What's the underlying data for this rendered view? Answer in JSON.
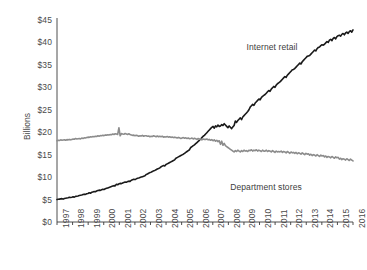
{
  "chart_data": {
    "type": "line",
    "title": "",
    "xlabel": "",
    "ylabel": "Billions",
    "ylim": [
      0,
      45
    ],
    "ytick_labels": [
      "$45",
      "$40",
      "$35",
      "$30",
      "$25",
      "$20",
      "$15",
      "$10",
      "$5",
      "$0"
    ],
    "ytick_values": [
      45,
      40,
      35,
      30,
      25,
      20,
      15,
      10,
      5,
      0
    ],
    "grid": false,
    "legend_position": "inline-annotation",
    "x": [
      "1997",
      "1998",
      "1999",
      "2000",
      "2001",
      "2002",
      "2003",
      "2004",
      "2005",
      "2006",
      "2007",
      "2008",
      "2009",
      "2010",
      "2011",
      "2012",
      "2013",
      "2014",
      "2015",
      "2016"
    ],
    "categories": [
      "1997",
      "1998",
      "1999",
      "2000",
      "2001",
      "2002",
      "2003",
      "2004",
      "2005",
      "2006",
      "2007",
      "2008",
      "2009",
      "2010",
      "2011",
      "2012",
      "2013",
      "2014",
      "2015",
      "2016"
    ],
    "series": [
      {
        "name": "Internet retail",
        "color": "#1a1a1a",
        "label_x": 272,
        "label_y": 42,
        "values": [
          5.1,
          5.6,
          6.3,
          7.2,
          8.4,
          9.3,
          10.6,
          12.3,
          14.2,
          16.6,
          19.6,
          21.4,
          22.5,
          25.6,
          28.4,
          31.2,
          34.2,
          37.1,
          39.6,
          42.4
        ],
        "monthly": [
          5.0,
          5.05,
          5.1,
          5.15,
          5.2,
          5.1,
          5.25,
          5.3,
          5.35,
          5.4,
          5.5,
          5.45,
          5.5,
          5.6,
          5.55,
          5.7,
          5.75,
          5.8,
          5.9,
          5.95,
          6.0,
          6.1,
          6.2,
          6.15,
          6.3,
          6.35,
          6.5,
          6.4,
          6.6,
          6.7,
          6.8,
          6.75,
          6.9,
          7.0,
          7.1,
          7.05,
          7.2,
          7.3,
          7.25,
          7.4,
          7.5,
          7.6,
          7.7,
          7.8,
          7.9,
          8.0,
          8.1,
          8.05,
          8.4,
          8.3,
          8.5,
          8.6,
          8.55,
          8.7,
          8.8,
          8.9,
          8.85,
          9.0,
          9.1,
          9.05,
          9.3,
          9.4,
          9.5,
          9.45,
          9.6,
          9.75,
          9.8,
          9.9,
          10.0,
          10.1,
          10.2,
          10.3,
          10.6,
          10.7,
          10.85,
          11.0,
          11.1,
          11.25,
          11.4,
          11.5,
          11.65,
          11.8,
          11.9,
          12.05,
          12.3,
          12.45,
          12.6,
          12.5,
          12.8,
          12.95,
          13.1,
          13.25,
          13.4,
          13.55,
          13.7,
          13.85,
          14.2,
          14.35,
          14.5,
          14.65,
          14.8,
          14.95,
          15.1,
          15.3,
          15.5,
          15.7,
          15.9,
          16.1,
          16.6,
          16.8,
          17.0,
          17.2,
          17.45,
          17.7,
          17.95,
          18.2,
          18.5,
          18.8,
          19.1,
          19.3,
          19.6,
          19.9,
          20.2,
          20.5,
          20.8,
          21.1,
          21.3,
          20.9,
          21.4,
          21.2,
          21.6,
          21.3,
          21.4,
          21.7,
          21.5,
          21.9,
          21.6,
          21.3,
          21.0,
          21.4,
          21.1,
          20.8,
          21.2,
          21.5,
          22.5,
          22.2,
          22.6,
          22.9,
          23.2,
          22.8,
          23.4,
          23.7,
          24.0,
          24.3,
          24.6,
          25.0,
          25.6,
          25.9,
          26.2,
          26.0,
          26.5,
          26.8,
          27.1,
          27.4,
          27.2,
          27.7,
          28.0,
          28.2,
          28.4,
          28.7,
          29.0,
          29.3,
          29.1,
          29.6,
          29.9,
          30.2,
          30.0,
          30.5,
          30.8,
          31.0,
          31.2,
          31.5,
          31.8,
          32.1,
          32.4,
          32.2,
          32.7,
          33.0,
          33.3,
          33.6,
          33.9,
          34.0,
          34.2,
          34.5,
          34.8,
          35.1,
          35.4,
          35.2,
          35.7,
          36.0,
          36.3,
          36.6,
          36.9,
          37.0,
          37.1,
          37.4,
          37.7,
          38.0,
          38.3,
          38.1,
          38.6,
          38.9,
          39.0,
          39.3,
          39.5,
          39.4,
          39.6,
          39.9,
          40.2,
          40.0,
          40.5,
          40.7,
          40.4,
          40.9,
          41.1,
          40.8,
          41.3,
          41.5,
          41.6,
          41.4,
          41.8,
          42.0,
          41.7,
          42.1,
          42.3,
          42.0,
          42.4,
          42.6,
          42.3,
          42.8
        ]
      },
      {
        "name": "Department stores",
        "color": "#8c8c8c",
        "label_x": 266,
        "label_y": 182,
        "values": [
          18.2,
          18.4,
          18.8,
          19.2,
          19.6,
          19.3,
          19.2,
          19.0,
          18.8,
          18.6,
          18.4,
          17.3,
          15.9,
          15.9,
          15.8,
          15.6,
          15.3,
          14.9,
          14.5,
          14.0
        ],
        "monthly": [
          18.1,
          18.2,
          18.15,
          18.3,
          18.2,
          18.25,
          18.3,
          18.2,
          18.35,
          18.3,
          18.4,
          18.3,
          18.4,
          18.5,
          18.45,
          18.6,
          18.5,
          18.55,
          18.6,
          18.5,
          18.7,
          18.6,
          18.75,
          18.7,
          18.8,
          18.9,
          18.85,
          19.0,
          18.95,
          19.05,
          19.0,
          19.1,
          19.05,
          19.2,
          19.1,
          19.25,
          19.2,
          19.3,
          19.25,
          19.4,
          19.35,
          19.45,
          19.4,
          19.5,
          19.45,
          19.6,
          19.5,
          19.65,
          19.6,
          19.5,
          21.0,
          19.2,
          19.7,
          19.6,
          19.55,
          19.7,
          19.6,
          19.5,
          19.65,
          19.5,
          19.4,
          19.3,
          19.35,
          19.2,
          19.3,
          19.25,
          19.1,
          19.2,
          19.15,
          19.3,
          19.1,
          19.2,
          19.2,
          19.1,
          19.15,
          19.0,
          19.1,
          19.05,
          19.2,
          19.1,
          19.0,
          19.15,
          19.0,
          19.1,
          19.0,
          19.1,
          18.9,
          19.0,
          18.95,
          19.05,
          18.9,
          19.0,
          18.85,
          18.95,
          18.8,
          18.9,
          18.8,
          18.7,
          18.85,
          18.75,
          18.6,
          18.7,
          18.8,
          18.65,
          18.75,
          18.6,
          18.7,
          18.55,
          18.6,
          18.7,
          18.5,
          18.65,
          18.55,
          18.4,
          18.6,
          18.45,
          18.55,
          18.3,
          18.5,
          18.4,
          18.4,
          18.5,
          18.3,
          18.4,
          18.2,
          18.35,
          18.1,
          18.3,
          18.0,
          18.2,
          17.9,
          18.1,
          17.3,
          18.0,
          17.1,
          17.5,
          17.0,
          16.8,
          16.6,
          16.4,
          16.2,
          16.0,
          15.8,
          15.6,
          15.9,
          15.7,
          16.0,
          15.8,
          15.6,
          15.9,
          15.7,
          16.0,
          15.8,
          15.9,
          15.7,
          16.0,
          15.9,
          16.1,
          15.8,
          16.0,
          15.9,
          16.1,
          15.8,
          16.0,
          15.9,
          15.7,
          16.0,
          15.8,
          15.8,
          16.0,
          15.7,
          15.9,
          15.8,
          15.6,
          15.9,
          15.7,
          15.5,
          15.8,
          15.6,
          15.7,
          15.6,
          15.8,
          15.5,
          15.7,
          15.6,
          15.4,
          15.7,
          15.5,
          15.3,
          15.6,
          15.4,
          15.5,
          15.3,
          15.5,
          15.2,
          15.4,
          15.3,
          15.1,
          15.4,
          15.2,
          15.0,
          15.3,
          15.1,
          15.2,
          14.9,
          15.1,
          14.8,
          15.0,
          14.9,
          14.7,
          15.0,
          14.8,
          14.6,
          14.9,
          14.7,
          14.8,
          14.5,
          14.7,
          14.4,
          14.6,
          14.5,
          14.3,
          14.6,
          14.4,
          14.2,
          14.5,
          14.3,
          14.4,
          14.0,
          14.2,
          13.9,
          14.1,
          14.0,
          13.8,
          14.1,
          13.9,
          13.7,
          14.0,
          13.8,
          13.6
        ]
      }
    ]
  }
}
